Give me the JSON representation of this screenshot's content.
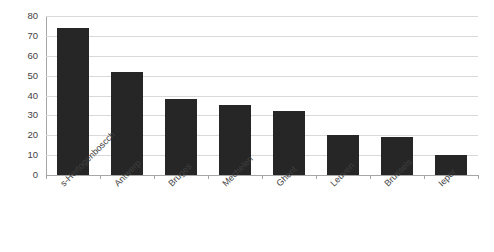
{
  "chart_data": {
    "type": "bar",
    "title": "",
    "subtitle": "",
    "xlabel": "",
    "ylabel": "",
    "categories": [
      "s-Hertogenboscch",
      "Antwerp",
      "Bruges",
      "Mechelen",
      "Ghent",
      "Leuven",
      "Brussels",
      "Ieper"
    ],
    "values": [
      74,
      52,
      38,
      35,
      32,
      20,
      19,
      10
    ],
    "ylim": [
      0,
      80
    ],
    "ytick_step": 10,
    "ytick_labels": [
      "0",
      "10",
      "20",
      "30",
      "40",
      "50",
      "60",
      "70",
      "80"
    ],
    "grid": true,
    "legend": false,
    "legend_position": "none",
    "bar_color": "#262626",
    "gridline_color": "#d9d9d9",
    "axis_color": "#a6a6a6",
    "background_color": "#ffffff",
    "tick_label_color": "#3f3f3f",
    "xlabel_rotation_degrees": -45
  }
}
